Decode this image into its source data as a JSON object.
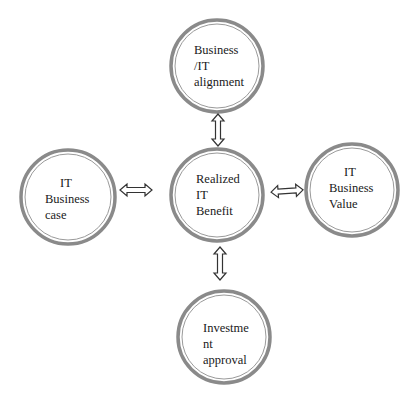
{
  "diagram": {
    "type": "hub-and-spoke",
    "center": {
      "id": "realized-it-benefit",
      "lines": [
        "Realized",
        "IT",
        "Benefit"
      ]
    },
    "nodes": [
      {
        "id": "business-it-alignment",
        "position": "top",
        "lines": [
          "Business",
          "/IT",
          "alignment"
        ]
      },
      {
        "id": "it-business-case",
        "position": "left",
        "lines": [
          "IT",
          "Business",
          "case"
        ]
      },
      {
        "id": "it-business-value",
        "position": "right",
        "lines": [
          "IT",
          "Business",
          "Value"
        ]
      },
      {
        "id": "investment-approval",
        "position": "bottom",
        "lines": [
          "Investme",
          "nt",
          "approval"
        ]
      }
    ],
    "edges": [
      {
        "from": "realized-it-benefit",
        "to": "business-it-alignment",
        "style": "double-headed-hollow-arrow"
      },
      {
        "from": "realized-it-benefit",
        "to": "it-business-case",
        "style": "double-headed-hollow-arrow"
      },
      {
        "from": "realized-it-benefit",
        "to": "it-business-value",
        "style": "double-headed-hollow-arrow"
      },
      {
        "from": "realized-it-benefit",
        "to": "investment-approval",
        "style": "double-headed-hollow-arrow"
      }
    ],
    "colors": {
      "ring_outer": "#8a8a8a",
      "ring_inner": "#9a9a9a",
      "arrow_stroke": "#333333",
      "text": "#1a1a1a",
      "background": "#ffffff"
    }
  }
}
